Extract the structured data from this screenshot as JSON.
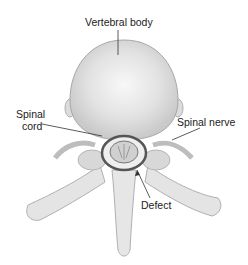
{
  "diagram": {
    "labels": {
      "vertebral_body": "Vertebral body",
      "spinal_cord_line1": "Spinal",
      "spinal_cord_line2": "cord",
      "spinal_nerve": "Spinal nerve",
      "defect": "Defect"
    },
    "colors": {
      "bone": "#e6e6e6",
      "bone_shadow": "#c8c8c8",
      "outline": "#a8a8a8",
      "cord_ring": "#444444",
      "text": "#222222"
    }
  }
}
